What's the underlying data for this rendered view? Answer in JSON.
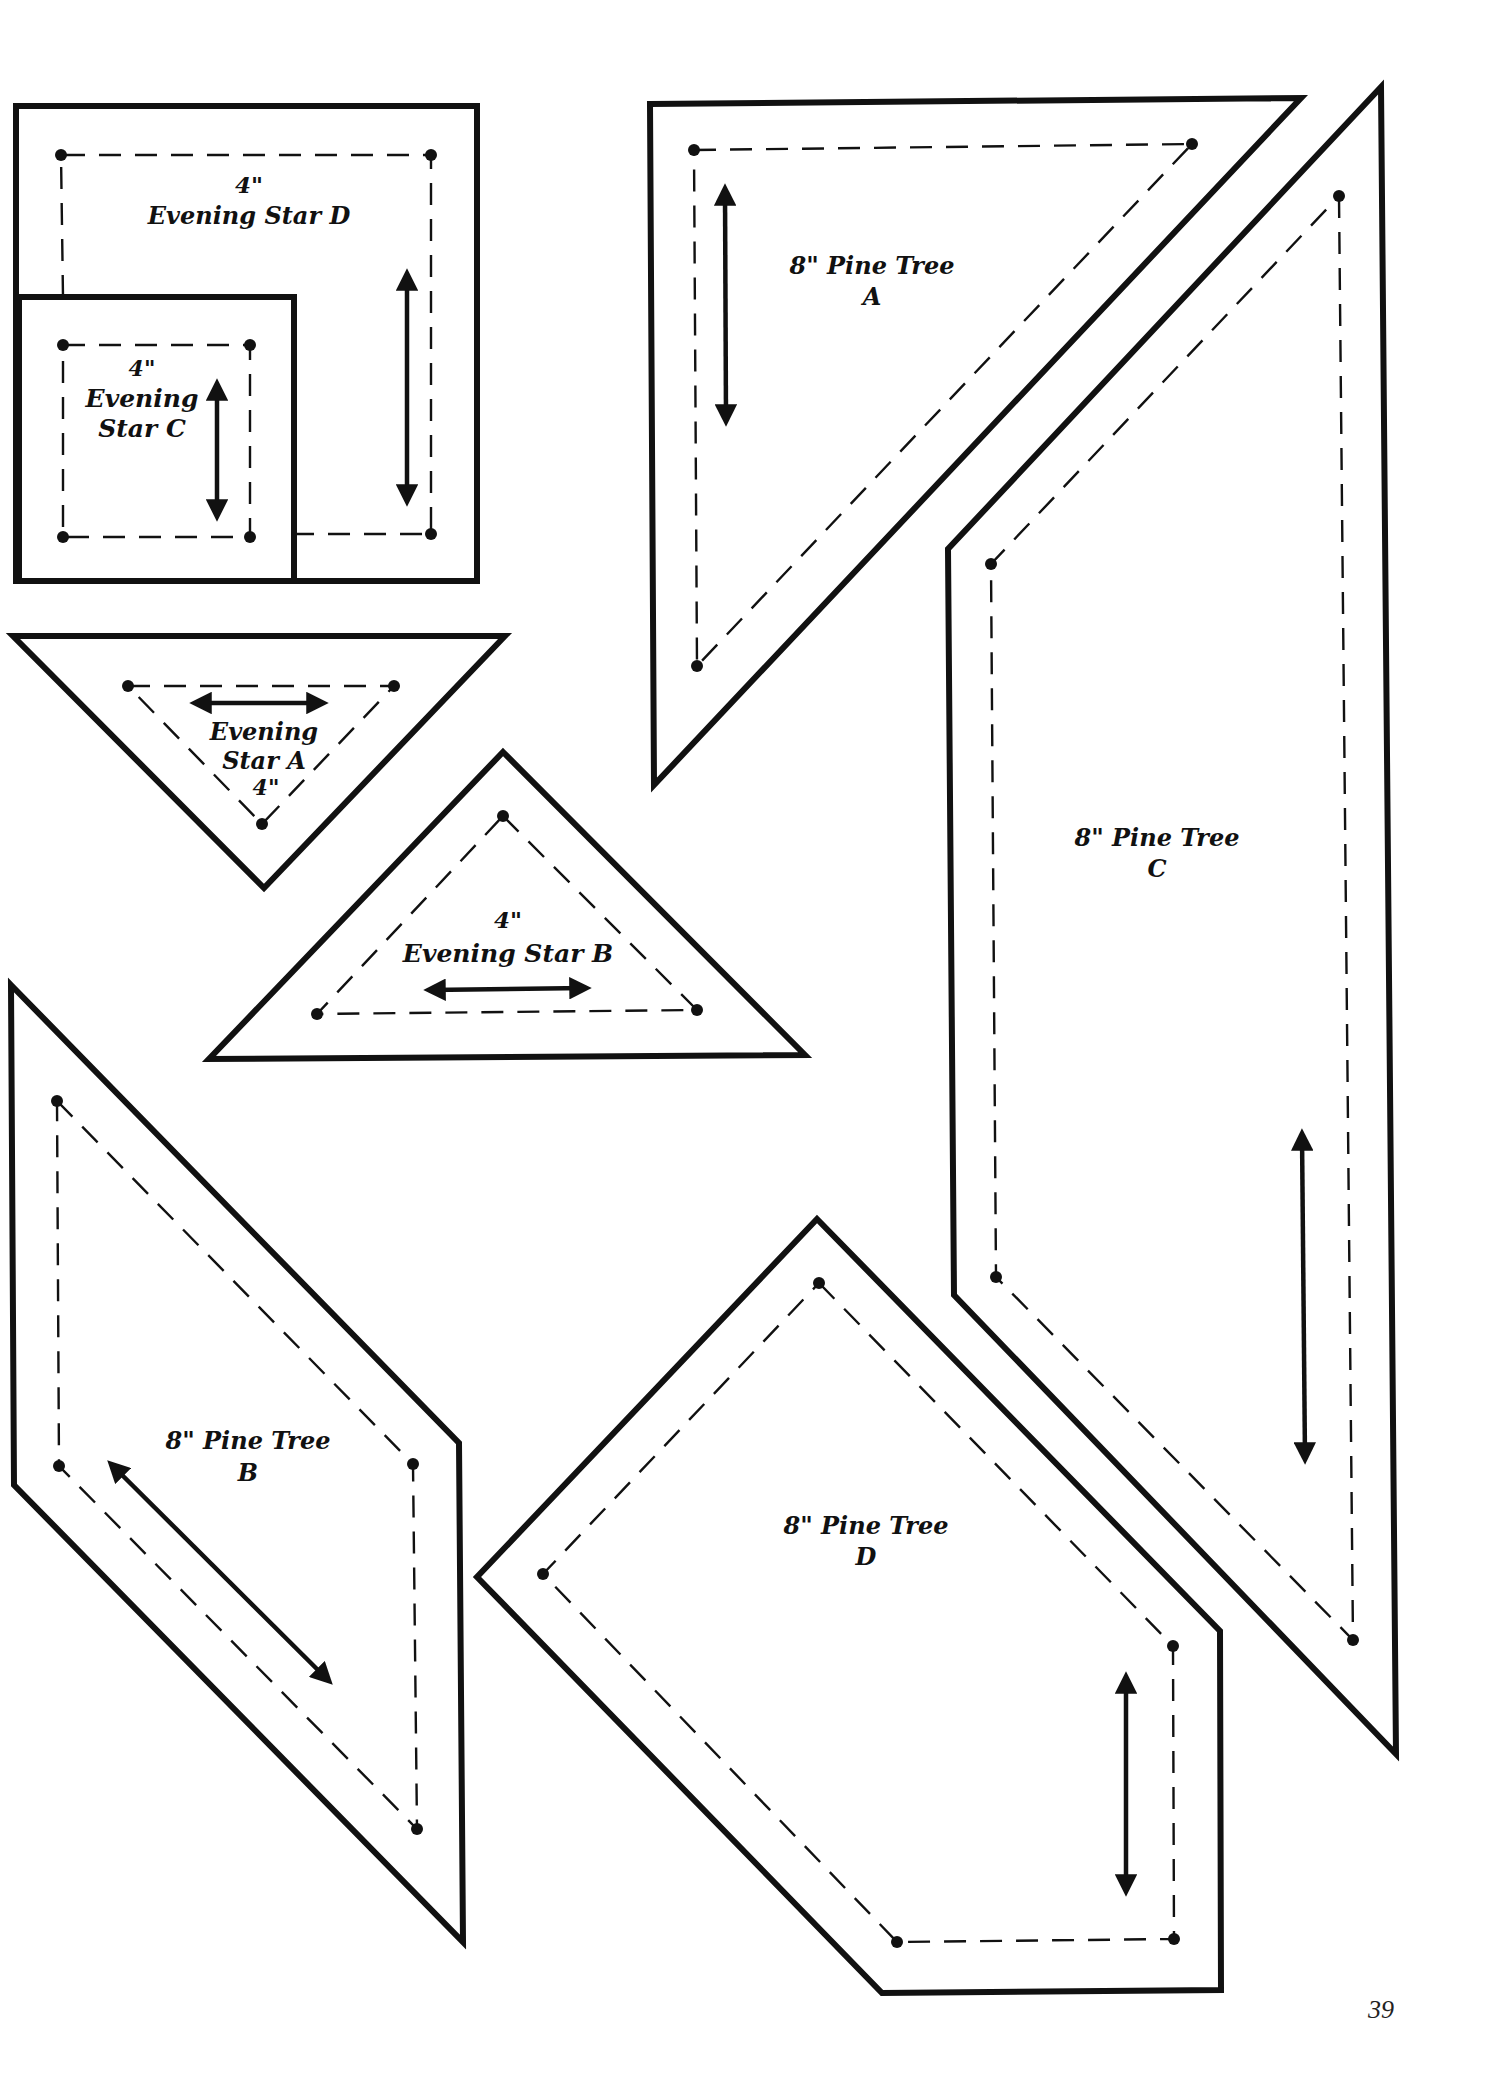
{
  "page": {
    "number": "39",
    "background": "#ffffff",
    "ink_color": "#111111"
  },
  "templates": [
    {
      "id": "evening-star-d",
      "size": "4\"",
      "name": "Evening Star D",
      "label_lines": [
        "4\"",
        "Evening Star D"
      ],
      "shape": "square",
      "grainline": "vertical"
    },
    {
      "id": "evening-star-c",
      "size": "4\"",
      "name": "Evening Star C",
      "label_lines": [
        "4\"",
        "Evening",
        "Star C"
      ],
      "shape": "square",
      "grainline": "vertical"
    },
    {
      "id": "evening-star-a",
      "size": "4\"",
      "name": "Evening Star A",
      "label_lines": [
        "Evening",
        "Star A",
        "4\""
      ],
      "shape": "triangle-down",
      "grainline": "horizontal"
    },
    {
      "id": "evening-star-b",
      "size": "4\"",
      "name": "Evening Star B",
      "label_lines": [
        "4\"",
        "Evening Star B"
      ],
      "shape": "triangle-up",
      "grainline": "horizontal"
    },
    {
      "id": "pine-tree-a",
      "size": "8\"",
      "name": "Pine Tree A",
      "label_lines": [
        "8\" Pine Tree",
        "A"
      ],
      "shape": "right-triangle",
      "grainline": "vertical"
    },
    {
      "id": "pine-tree-c",
      "size": "8\"",
      "name": "Pine Tree C",
      "label_lines": [
        "8\" Pine Tree",
        "C"
      ],
      "shape": "quadrilateral",
      "grainline": "vertical"
    },
    {
      "id": "pine-tree-b",
      "size": "8\"",
      "name": "Pine Tree B",
      "label_lines": [
        "8\" Pine Tree",
        "B"
      ],
      "shape": "parallelogram",
      "grainline": "diagonal"
    },
    {
      "id": "pine-tree-d",
      "size": "8\"",
      "name": "Pine Tree D",
      "label_lines": [
        "8\" Pine Tree",
        "D"
      ],
      "shape": "pentagon",
      "grainline": "vertical"
    }
  ]
}
